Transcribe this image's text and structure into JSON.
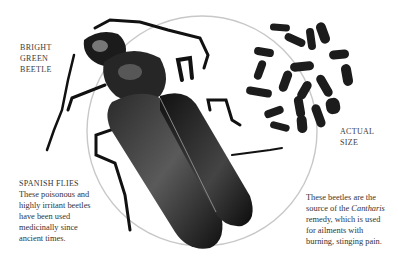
{
  "labels": {
    "bright_green_beetle": [
      "BRIGHT",
      "GREEN",
      "BEETLE"
    ],
    "actual_size": [
      "ACTUAL",
      "SIZE"
    ]
  },
  "caption_left": {
    "heading": "SPANISH FLIES",
    "lines": [
      "These poisonous and",
      "highly irritant beetles",
      "have been used",
      "medicinally since",
      "ancient times."
    ]
  },
  "caption_right": {
    "line1": "These beetles are the",
    "line2_pre": "source of the ",
    "line2_italic": "Cantharis",
    "lines_rest": [
      "remedy, which is used",
      "for ailments with",
      "burning, stinging pain."
    ]
  },
  "illustration": {
    "subject": "beetle-illustration",
    "circle_color": "#c8c8c8",
    "beetle_color": "#1a1a1a"
  }
}
